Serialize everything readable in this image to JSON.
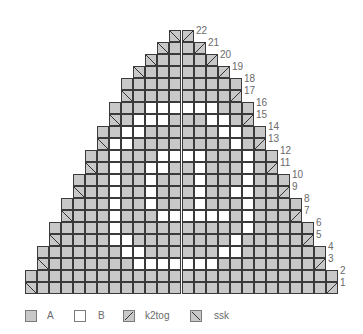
{
  "chart": {
    "cell_size_px": 12,
    "origin_x": 25,
    "bottom_y": 294,
    "colors": {
      "A": "#c8c8c8",
      "B": "#ffffff",
      "grid": "#3a3a3a",
      "number": "#6a6a6a"
    },
    "rows": [
      {
        "num": "1",
        "start": 0,
        "end": 25,
        "decrease": true,
        "white": []
      },
      {
        "num": "2",
        "start": 0,
        "end": 25,
        "decrease": false,
        "white": []
      },
      {
        "num": "3",
        "start": 1,
        "end": 24,
        "decrease": true,
        "white": [
          9,
          10,
          11,
          12,
          13,
          14,
          15
        ]
      },
      {
        "num": "4",
        "start": 1,
        "end": 24,
        "decrease": false,
        "white": [
          8,
          9,
          16,
          17
        ]
      },
      {
        "num": "5",
        "start": 2,
        "end": 23,
        "decrease": true,
        "white": [
          7,
          8,
          17
        ]
      },
      {
        "num": "6",
        "start": 2,
        "end": 23,
        "decrease": false,
        "white": [
          7,
          18
        ]
      },
      {
        "num": "7",
        "start": 3,
        "end": 22,
        "decrease": true,
        "white": [
          7,
          11,
          12,
          13,
          14,
          15,
          16,
          18
        ]
      },
      {
        "num": "8",
        "start": 3,
        "end": 22,
        "decrease": false,
        "white": [
          7,
          10,
          14,
          18
        ]
      },
      {
        "num": "9",
        "start": 4,
        "end": 21,
        "decrease": true,
        "white": [
          7,
          10,
          14,
          17,
          18
        ]
      },
      {
        "num": "10",
        "start": 4,
        "end": 21,
        "decrease": false,
        "white": [
          7,
          10,
          14,
          18
        ]
      },
      {
        "num": "11",
        "start": 5,
        "end": 20,
        "decrease": true,
        "white": [
          7,
          10,
          11,
          14,
          18
        ]
      },
      {
        "num": "12",
        "start": 5,
        "end": 20,
        "decrease": false,
        "white": [
          7,
          11,
          12,
          13,
          14,
          18
        ]
      },
      {
        "num": "13",
        "start": 6,
        "end": 19,
        "decrease": true,
        "white": [
          7,
          8,
          17
        ]
      },
      {
        "num": "14",
        "start": 6,
        "end": 19,
        "decrease": false,
        "white": [
          8,
          9,
          16,
          17
        ]
      },
      {
        "num": "15",
        "start": 7,
        "end": 18,
        "decrease": true,
        "white": [
          9,
          10,
          11,
          15,
          16
        ]
      },
      {
        "num": "16",
        "start": 7,
        "end": 18,
        "decrease": false,
        "white": [
          10,
          11,
          12,
          13,
          14,
          15
        ]
      },
      {
        "num": "17",
        "start": 8,
        "end": 17,
        "decrease": true,
        "white": []
      },
      {
        "num": "18",
        "start": 8,
        "end": 17,
        "decrease": false,
        "white": []
      },
      {
        "num": "19",
        "start": 9,
        "end": 16,
        "decrease": true,
        "white": []
      },
      {
        "num": "20",
        "start": 10,
        "end": 15,
        "decrease": true,
        "white": []
      },
      {
        "num": "21",
        "start": 11,
        "end": 14,
        "decrease": true,
        "white": []
      },
      {
        "num": "22",
        "start": 12,
        "end": 13,
        "decrease": true,
        "white": []
      }
    ]
  },
  "legend": {
    "items": [
      {
        "key": "A",
        "label": "A",
        "symbol": "solid-gray"
      },
      {
        "key": "B",
        "label": "B",
        "symbol": "white"
      },
      {
        "key": "k2tog",
        "label": "k2tog",
        "symbol": "slash"
      },
      {
        "key": "ssk",
        "label": "ssk",
        "symbol": "backslash"
      }
    ]
  }
}
